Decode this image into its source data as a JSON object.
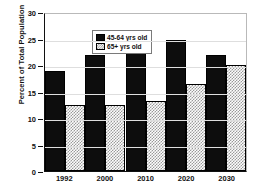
{
  "chart_data": {
    "type": "bar",
    "title": "",
    "xlabel": "",
    "ylabel": "Percent of Total Population",
    "categories": [
      "1992",
      "2000",
      "2010",
      "2020",
      "2030"
    ],
    "ylim": [
      0,
      30
    ],
    "yticks": [
      "0",
      "5",
      "10",
      "15",
      "20",
      "25",
      "30"
    ],
    "grid": true,
    "legend_position": "top-left",
    "series": [
      {
        "name": "45-64 yrs old",
        "color": "#0d0d0d",
        "pattern": "solid",
        "values": [
          19.0,
          22.1,
          26.5,
          24.8,
          22.0
        ]
      },
      {
        "name": "65+ yrs old",
        "color": "#9a9a9a",
        "pattern": "checkered",
        "values": [
          12.5,
          12.6,
          13.3,
          16.6,
          20.1
        ]
      }
    ]
  }
}
